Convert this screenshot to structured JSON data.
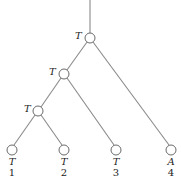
{
  "tree": {
    "internal_nodes": [
      {
        "id": "n1",
        "label": "T",
        "x": 90,
        "y": 38
      },
      {
        "id": "n2",
        "label": "T",
        "x": 64,
        "y": 74
      },
      {
        "id": "n3",
        "label": "T",
        "x": 38,
        "y": 111
      }
    ],
    "leaves": [
      {
        "id": "l1",
        "label": "T",
        "number": "1",
        "x": 12,
        "y": 150
      },
      {
        "id": "l2",
        "label": "T",
        "number": "2",
        "x": 64,
        "y": 150
      },
      {
        "id": "l3",
        "label": "T",
        "number": "3",
        "x": 116,
        "y": 150
      },
      {
        "id": "l4",
        "label": "A",
        "number": "4",
        "x": 171,
        "y": 150
      }
    ]
  }
}
